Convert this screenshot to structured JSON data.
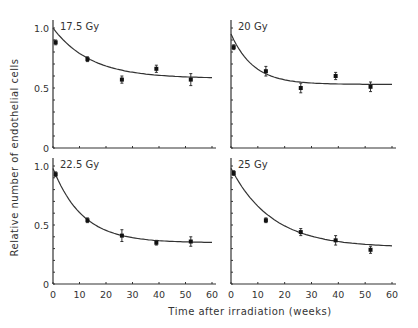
{
  "chart_data": {
    "type": "scatter",
    "layout": "2x2 panels with fitted exponential curves and error bars",
    "xlabel": "Time after irradiation (weeks)",
    "ylabel": "Relative number of endothelial cells",
    "xlim": [
      0,
      60
    ],
    "ylim": [
      0,
      1.0
    ],
    "x_ticks": [
      "0",
      "10",
      "20",
      "30",
      "40",
      "50",
      "60"
    ],
    "y_ticks": [
      "0",
      "0.5",
      "1.0"
    ],
    "grid": false,
    "panels": [
      {
        "label": "17.5 Gy",
        "points": [
          {
            "x": 1,
            "y": 0.88,
            "err": 0.02
          },
          {
            "x": 13,
            "y": 0.74,
            "err": 0.02
          },
          {
            "x": 26,
            "y": 0.57,
            "err": 0.03
          },
          {
            "x": 39,
            "y": 0.66,
            "err": 0.03
          },
          {
            "x": 52,
            "y": 0.57,
            "err": 0.05
          }
        ],
        "fit": {
          "y0": 1.0,
          "plateau": 0.58,
          "k": 0.07
        }
      },
      {
        "label": "20 Gy",
        "points": [
          {
            "x": 1,
            "y": 0.84,
            "err": 0.02
          },
          {
            "x": 13,
            "y": 0.64,
            "err": 0.04
          },
          {
            "x": 26,
            "y": 0.5,
            "err": 0.04
          },
          {
            "x": 39,
            "y": 0.6,
            "err": 0.03
          },
          {
            "x": 52,
            "y": 0.51,
            "err": 0.04
          }
        ],
        "fit": {
          "y0": 0.95,
          "plateau": 0.53,
          "k": 0.12
        }
      },
      {
        "label": "22.5 Gy",
        "points": [
          {
            "x": 1,
            "y": 0.93,
            "err": 0.02
          },
          {
            "x": 13,
            "y": 0.54,
            "err": 0.02
          },
          {
            "x": 26,
            "y": 0.41,
            "err": 0.05
          },
          {
            "x": 39,
            "y": 0.35,
            "err": 0.02
          },
          {
            "x": 52,
            "y": 0.36,
            "err": 0.04
          }
        ],
        "fit": {
          "y0": 0.98,
          "plateau": 0.35,
          "k": 0.09
        }
      },
      {
        "label": "25 Gy",
        "points": [
          {
            "x": 1,
            "y": 0.94,
            "err": 0.02
          },
          {
            "x": 13,
            "y": 0.54,
            "err": 0.02
          },
          {
            "x": 26,
            "y": 0.44,
            "err": 0.03
          },
          {
            "x": 39,
            "y": 0.37,
            "err": 0.04
          },
          {
            "x": 52,
            "y": 0.29,
            "err": 0.03
          }
        ],
        "fit": {
          "y0": 0.98,
          "plateau": 0.31,
          "k": 0.065
        }
      }
    ]
  },
  "labels": {
    "xlabel": "Time after irradiation (weeks)",
    "ylabel": "Relative number of endothelial cells"
  }
}
